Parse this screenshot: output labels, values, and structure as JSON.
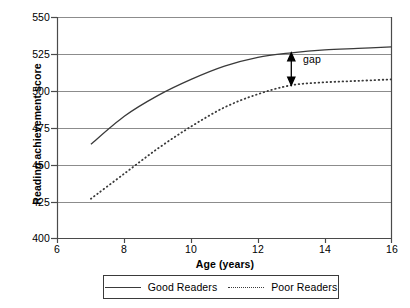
{
  "chart_data": {
    "type": "line",
    "title": "",
    "xlabel": "Age (years)",
    "ylabel": "Reading achievement score",
    "xlim": [
      6,
      16
    ],
    "ylim": [
      400,
      550
    ],
    "xticks": [
      6,
      8,
      10,
      12,
      14,
      16
    ],
    "yticks": [
      400,
      425,
      450,
      475,
      500,
      525,
      550
    ],
    "grid": "horizontal",
    "legend_position": "bottom-outside",
    "x": [
      7,
      8,
      9,
      10,
      11,
      12,
      13,
      14,
      15,
      16
    ],
    "series": [
      {
        "name": "Good Readers",
        "style": "solid",
        "color": "#3a3a3a",
        "values": [
          464,
          483,
          497,
          508,
          517,
          523,
          526,
          528,
          529,
          530
        ]
      },
      {
        "name": "Poor Readers",
        "style": "dotted",
        "color": "#3a3a3a",
        "values": [
          427,
          444,
          461,
          476,
          489,
          498,
          504,
          506,
          507,
          508
        ]
      }
    ],
    "annotations": [
      {
        "label": "gap",
        "type": "double-arrow",
        "at_x": 13,
        "y_top": 526,
        "y_bottom": 504
      }
    ]
  },
  "axes": {
    "y_tick_labels": [
      "550",
      "525",
      "500",
      "475",
      "450",
      "425",
      "400"
    ],
    "x_tick_labels": [
      "6",
      "8",
      "10",
      "12",
      "14",
      "16"
    ],
    "y_title": "Reading achievement score",
    "x_title": "Age (years)"
  },
  "legend": {
    "entries": [
      {
        "label": "Good Readers",
        "style": "solid"
      },
      {
        "label": "Poor Readers",
        "style": "dotted"
      }
    ]
  },
  "annotation": {
    "gap_label": "gap"
  },
  "colors": {
    "line": "#3a3a3a",
    "grid": "#8c8c8c",
    "axis": "#4a4a4a",
    "background": "#ffffff"
  }
}
